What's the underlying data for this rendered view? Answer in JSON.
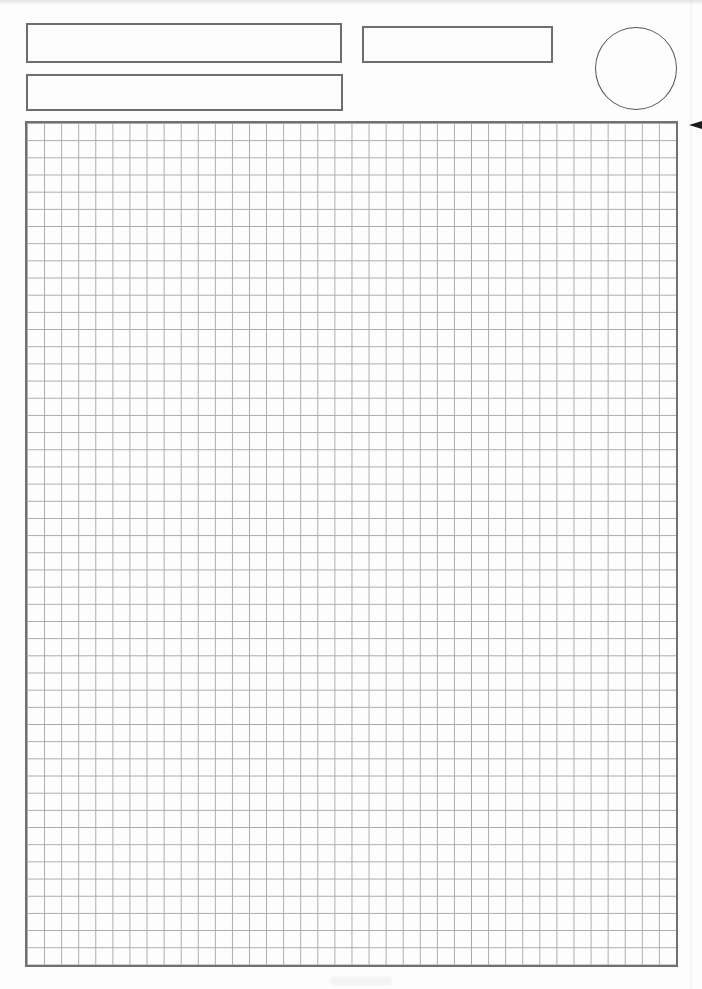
{
  "page": {
    "background_color": "#fdfdfd",
    "visible_text": ""
  },
  "header_fields": {
    "wide_box_1": {
      "value": ""
    },
    "wide_box_2": {
      "value": ""
    },
    "small_box": {
      "value": ""
    },
    "circle_field": {
      "value": ""
    }
  },
  "grid_paper": {
    "columns": 38,
    "rows": 49,
    "line_color": "#a9a9a9",
    "border_color": "#707070"
  },
  "colors": {
    "field_border": "#6e6e6e",
    "circle_border": "#565656",
    "edge_arrow_mark": "#1b1b1b",
    "scan_artifact": "#787878"
  },
  "marks": {
    "edge_arrow": "left-pointing-arrow-mark"
  }
}
